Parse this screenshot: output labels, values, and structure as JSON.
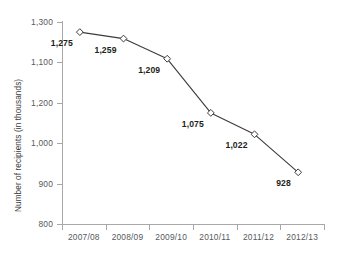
{
  "chart_data": {
    "type": "line",
    "title": "",
    "subtitle": "",
    "xlabel": "",
    "ylabel": "Number of recipients (in thousands)",
    "categories": [
      "2007/08",
      "2008/09",
      "2009/10",
      "2010/11",
      "2011/12",
      "2012/13"
    ],
    "values": [
      1275,
      1259,
      1209,
      1075,
      1022,
      928
    ],
    "point_labels": [
      "1,275",
      "1,259",
      "1,209",
      "1,075",
      "1,022",
      "928"
    ],
    "ylim": [
      800,
      1300
    ],
    "ytick_labels": [
      "1,300",
      "1,100",
      "1,200",
      "1,000",
      "900",
      "800"
    ],
    "ytick_values": [
      1300,
      1200,
      1100,
      1000,
      900,
      800
    ],
    "grid": false,
    "legend": false,
    "legend_position": "none",
    "marker": "open-diamond",
    "line_color": "#3b3b3b",
    "marker_fill": "#ffffff",
    "axis_color": "#a8a8a8",
    "label_color": "#58595b",
    "data_label_color": "#231f20",
    "background": "#ffffff"
  }
}
